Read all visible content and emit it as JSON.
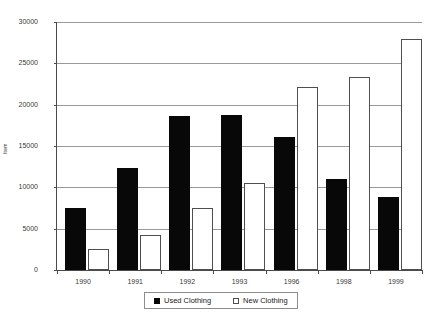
{
  "chart_data": {
    "type": "bar",
    "title": "",
    "xlabel": "",
    "ylabel": "Item",
    "categories": [
      "1990",
      "1991",
      "1992",
      "1993",
      "1996",
      "1998",
      "1999"
    ],
    "series": [
      {
        "name": "Used Clothing",
        "color": "#080808",
        "values": [
          7500,
          12400,
          18600,
          18800,
          16100,
          11000,
          8800
        ]
      },
      {
        "name": "New Clothing",
        "color": "#ffffff",
        "values": [
          2550,
          4200,
          7500,
          10500,
          22100,
          23400,
          28000
        ]
      }
    ],
    "ylim": [
      0,
      30000
    ],
    "yticks": [
      0,
      5000,
      10000,
      15000,
      20000,
      25000,
      30000
    ],
    "ytick_labels": [
      "0",
      "5000",
      "10000",
      "15000",
      "20000",
      "25000",
      "30000"
    ],
    "grid": true,
    "legend_position": "bottom"
  },
  "legend": {
    "entries": [
      {
        "label": "Used Clothing"
      },
      {
        "label": "New Clothing"
      }
    ]
  }
}
